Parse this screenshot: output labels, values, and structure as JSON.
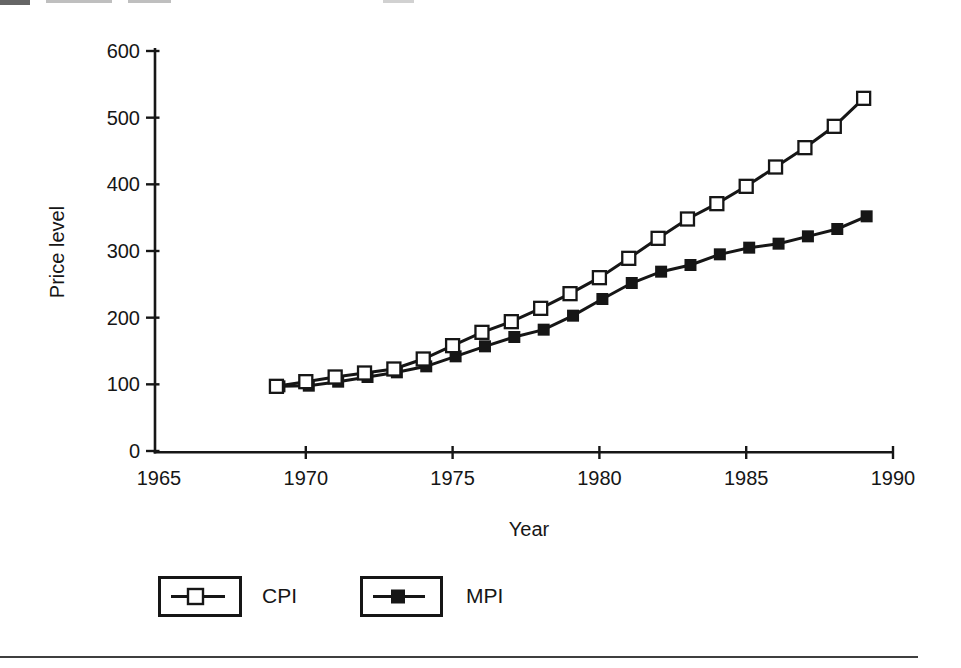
{
  "colors": {
    "ink": "#161616",
    "rule": "#3f3f3f"
  },
  "chart_data": {
    "type": "line",
    "title": "",
    "xlabel": "Year",
    "ylabel": "Price level",
    "x": [
      1969,
      1970,
      1971,
      1972,
      1973,
      1974,
      1975,
      1976,
      1977,
      1978,
      1979,
      1980,
      1981,
      1982,
      1983,
      1984,
      1985,
      1986,
      1987,
      1988,
      1989
    ],
    "series": [
      {
        "name": "CPI",
        "marker": "open-square",
        "line_color": "#161616",
        "marker_fill": "#ffffff",
        "values": [
          97,
          104,
          111,
          117,
          123,
          138,
          158,
          178,
          194,
          214,
          236,
          260,
          289,
          319,
          348,
          371,
          397,
          426,
          455,
          487,
          529
        ]
      },
      {
        "name": "MPI",
        "marker": "filled-square",
        "line_color": "#161616",
        "marker_fill": "#161616",
        "values": [
          97,
          98,
          104,
          111,
          118,
          127,
          142,
          157,
          171,
          182,
          203,
          228,
          252,
          269,
          279,
          295,
          305,
          311,
          322,
          333,
          352
        ]
      }
    ],
    "xlim": [
      1965,
      1990
    ],
    "ylim": [
      0,
      600
    ],
    "x_ticks": [
      1965,
      1970,
      1975,
      1980,
      1985,
      1990
    ],
    "y_ticks": [
      0,
      100,
      200,
      300,
      400,
      500,
      600
    ],
    "grid": false,
    "legend_position": "bottom"
  },
  "legend": {
    "items": [
      {
        "label": "CPI"
      },
      {
        "label": "MPI"
      }
    ]
  }
}
